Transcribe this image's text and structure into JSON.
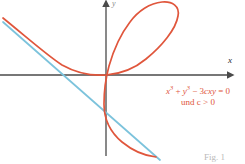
{
  "figure": {
    "caption": "Fig. 1",
    "background_color": "#ffffff"
  },
  "axes": {
    "x_label": "x",
    "y_label": "y",
    "axis_color": "#4a4a4a",
    "origin_px": {
      "x": 106,
      "y": 75
    }
  },
  "annotation": {
    "equation_main": "x",
    "equation_exp_1": "3",
    "equation_plus": " + ",
    "equation_y": "y",
    "equation_exp_2": "3",
    "equation_minus": " − 3",
    "equation_cxy": "cxy",
    "equation_equals": " = 0",
    "condition": "und c > 0",
    "color": "#E0563C"
  },
  "chart_data": {
    "type": "line",
    "xlabel": "x",
    "ylabel": "y",
    "grid": false,
    "legend": null,
    "annotations": [
      {
        "text": "x³ + y³ − 3cxy = 0",
        "color": "#E0563C"
      },
      {
        "text": "und c > 0",
        "color": "#E0563C"
      }
    ],
    "series": [
      {
        "name": "folium-curve",
        "equation": "x^3 + y^3 - 3cxy = 0",
        "color": "#E0563C",
        "width": 1.6,
        "path": "M 3,18 C 30,40 48,56 62,65 C 78,74 92,76 106,75 C 120,74 134,69 146,59 C 162,46 176,29 178,16 C 180,6 172,1 162,2 C 150,3 138,11 130,22 C 120,35 113,52 109,66 C 106,77 104,92 104,104 C 104,118 110,132 122,142 C 133,151 146,156 156,157"
      },
      {
        "name": "asymptote-line",
        "equation": "x + y + c = 0",
        "color": "#7CC3DC",
        "width": 1.6,
        "path": "M 3,22 L 160,160"
      }
    ],
    "axis_ranges": {
      "x": [
        -3.2,
        4.2
      ],
      "y": [
        -3.4,
        3.2
      ]
    }
  }
}
